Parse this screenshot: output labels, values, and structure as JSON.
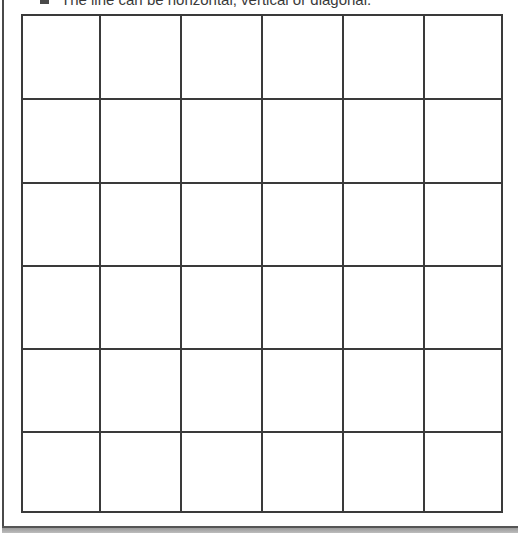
{
  "instruction": {
    "bullet_icon": "square-bullet-icon",
    "text": "The line can be horizontal, vertical or diagonal."
  },
  "grid": {
    "rows": 6,
    "columns": 6,
    "line_color": "#3a3a3a",
    "cells": [
      [
        "",
        "",
        "",
        "",
        "",
        ""
      ],
      [
        "",
        "",
        "",
        "",
        "",
        ""
      ],
      [
        "",
        "",
        "",
        "",
        "",
        ""
      ],
      [
        "",
        "",
        "",
        "",
        "",
        ""
      ],
      [
        "",
        "",
        "",
        "",
        "",
        ""
      ],
      [
        "",
        "",
        "",
        "",
        "",
        ""
      ]
    ]
  }
}
